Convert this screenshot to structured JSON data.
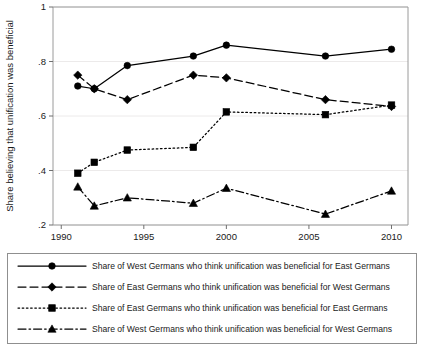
{
  "chart_data": {
    "type": "line",
    "title": "",
    "xlabel": "",
    "ylabel": "Share believing that unification was beneficial",
    "x": [
      1991,
      1992,
      1994,
      1998,
      2000,
      2006,
      2010
    ],
    "xlim": [
      1989.5,
      2011
    ],
    "ylim": [
      0.2,
      1.0
    ],
    "xticks": [
      1990,
      1995,
      2000,
      2005,
      2010
    ],
    "xtick_labels": [
      "1990",
      "1995",
      "2000",
      "2005",
      "2010"
    ],
    "yticks": [
      0.2,
      0.4,
      0.6,
      0.8,
      1.0
    ],
    "ytick_labels": [
      ".2",
      ".4",
      ".6",
      ".8",
      "1"
    ],
    "grid": true,
    "legend_position": "below-plot",
    "series": [
      {
        "name": "Share of West Germans who think unification was beneficial for East Germans",
        "marker": "circle",
        "linestyle": "solid",
        "color": "#000000",
        "values": [
          0.71,
          0.7,
          0.785,
          0.82,
          0.86,
          0.82,
          0.845
        ]
      },
      {
        "name": "Share of East Germans who think unification was beneficial for West Germans",
        "marker": "diamond",
        "linestyle": "dashed",
        "color": "#000000",
        "values": [
          0.75,
          0.7,
          0.66,
          0.75,
          0.74,
          0.66,
          0.635
        ]
      },
      {
        "name": "Share of East Germans who think unification was beneficial for East Germans",
        "marker": "square",
        "linestyle": "dotted",
        "color": "#000000",
        "values": [
          0.39,
          0.43,
          0.475,
          0.485,
          0.615,
          0.605,
          0.64
        ]
      },
      {
        "name": "Share of West Germans who think unification was beneficial for West Germans",
        "marker": "triangle",
        "linestyle": "dashdot",
        "color": "#000000",
        "values": [
          0.34,
          0.27,
          0.3,
          0.28,
          0.335,
          0.24,
          0.325
        ]
      }
    ]
  },
  "legend": {
    "entries": [
      {
        "label": "Share of West Germans who think unification was beneficial for East Germans"
      },
      {
        "label": "Share of East Germans who think unification was beneficial for West Germans"
      },
      {
        "label": "Share of East Germans who think unification was beneficial for East Germans"
      },
      {
        "label": "Share of West Germans who think unification was beneficial for West Germans"
      }
    ]
  }
}
